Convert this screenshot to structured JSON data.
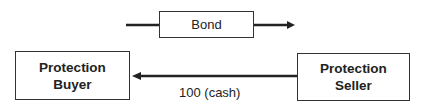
{
  "bond": {
    "label": "Bond"
  },
  "buyer": {
    "line1": "Protection",
    "line2": "Buyer"
  },
  "seller": {
    "line1": "Protection",
    "line2": "Seller"
  },
  "cash_flow": {
    "label": "100 (cash)"
  }
}
